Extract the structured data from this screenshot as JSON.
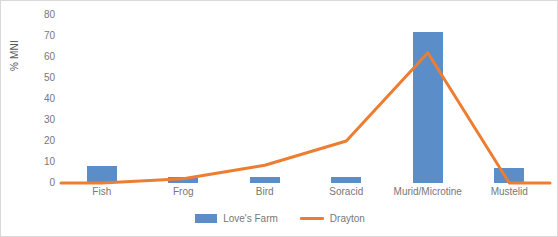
{
  "chart_data": {
    "type": "bar",
    "title": "",
    "subtitle": "",
    "xlabel": "",
    "ylabel": "% MNI",
    "ylim": [
      0,
      80
    ],
    "ytick_labels": [
      "80",
      "70",
      "60",
      "50",
      "40",
      "30",
      "20",
      "10",
      "0"
    ],
    "ytick_values": [
      80,
      70,
      60,
      50,
      40,
      30,
      20,
      10,
      0
    ],
    "grid": false,
    "legend_position": "bottom-center",
    "categories": [
      "Fish",
      "Frog",
      "Bird",
      "Soracid",
      "Murid/Microtine",
      "Mustelid"
    ],
    "series": [
      {
        "name": "Love's Farm",
        "type": "bar",
        "color": "#5B8DC8",
        "values": [
          8,
          3,
          3,
          3,
          72,
          7
        ]
      },
      {
        "name": "Drayton",
        "type": "line",
        "color": "#ED7D31",
        "values": [
          0,
          2,
          8.5,
          20,
          62,
          0
        ]
      }
    ]
  },
  "legend": {
    "items": [
      {
        "label": "Love's Farm",
        "marker": "bar-swatch",
        "color": "#5B8DC8"
      },
      {
        "label": "Drayton",
        "marker": "line-swatch",
        "color": "#ED7D31"
      }
    ]
  },
  "colors": {
    "bar_series": "#5B8DC8",
    "line_series": "#ED7D31",
    "axis_text": "#777777",
    "axis_title_text": "#595959",
    "plot_background": "#ffffff",
    "frame_border": "#d9d9d9"
  }
}
